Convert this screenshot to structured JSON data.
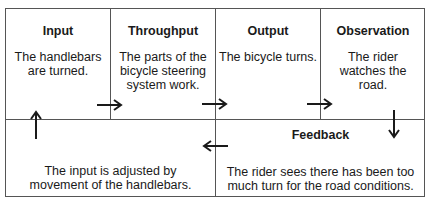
{
  "diagram": {
    "cells": [
      {
        "id": "input",
        "title": "Input",
        "body": "The handlebars are turned."
      },
      {
        "id": "throughput",
        "title": "Throughput",
        "body": "The parts of the bicycle steering system work."
      },
      {
        "id": "output",
        "title": "Output",
        "body": "The bicycle turns."
      },
      {
        "id": "observation",
        "title": "Observation",
        "body": "The rider watches the road."
      },
      {
        "id": "adjustment",
        "title": "",
        "body": "The input is adjusted by movement of the handlebars."
      },
      {
        "id": "feedback",
        "title": "Feedback",
        "body": "The rider sees there has been too much turn for the road conditions."
      }
    ],
    "arrows": [
      {
        "from": "input",
        "to": "throughput",
        "direction": "right"
      },
      {
        "from": "throughput",
        "to": "output",
        "direction": "right"
      },
      {
        "from": "output",
        "to": "observation",
        "direction": "right"
      },
      {
        "from": "observation",
        "to": "feedback",
        "direction": "down"
      },
      {
        "from": "feedback",
        "to": "adjustment",
        "direction": "left"
      },
      {
        "from": "adjustment",
        "to": "input",
        "direction": "up"
      }
    ],
    "colors": {
      "border": "#555555",
      "text": "#1a1a1a",
      "arrow": "#1a1a1a"
    }
  }
}
